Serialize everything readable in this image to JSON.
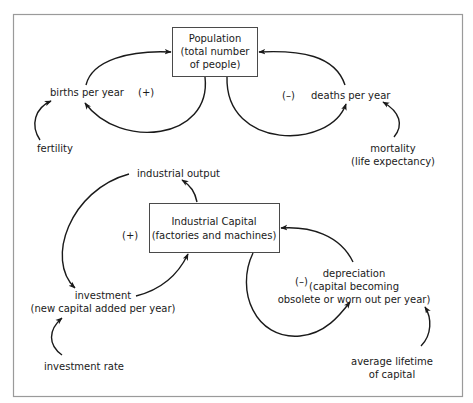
{
  "diagram": {
    "type": "causal-loop-diagram",
    "stocks": [
      {
        "id": "population",
        "lines": [
          "Population",
          "(total number",
          "of people)"
        ]
      },
      {
        "id": "industrial_capital",
        "lines": [
          "Industrial Capital",
          "(factories and machines)"
        ]
      }
    ],
    "variables": {
      "births": {
        "lines": [
          "births per year"
        ]
      },
      "deaths": {
        "lines": [
          "deaths per year"
        ]
      },
      "fertility": {
        "lines": [
          "fertility"
        ]
      },
      "mortality": {
        "lines": [
          "mortality",
          "(life expectancy)"
        ]
      },
      "industrial_output": {
        "lines": [
          "industrial output"
        ]
      },
      "investment": {
        "lines": [
          "investment",
          "(new capital added per year)"
        ]
      },
      "depreciation": {
        "lines": [
          "depreciation",
          "(capital becoming",
          "obsolete or worn out per year)"
        ]
      },
      "investment_rate": {
        "lines": [
          "investment rate"
        ]
      },
      "average_lifetime": {
        "lines": [
          "average lifetime",
          "of capital"
        ]
      }
    },
    "loop_signs": {
      "births_loop": "(+)",
      "deaths_loop": "(–)",
      "investment_loop": "(+)",
      "depreciation_loop": "(–)"
    },
    "links": [
      {
        "from": "births per year",
        "to": "Population"
      },
      {
        "from": "Population",
        "to": "births per year"
      },
      {
        "from": "fertility",
        "to": "births per year"
      },
      {
        "from": "deaths per year",
        "to": "Population"
      },
      {
        "from": "Population",
        "to": "deaths per year"
      },
      {
        "from": "mortality",
        "to": "deaths per year"
      },
      {
        "from": "Industrial Capital",
        "to": "industrial output"
      },
      {
        "from": "industrial output",
        "to": "investment"
      },
      {
        "from": "investment",
        "to": "Industrial Capital"
      },
      {
        "from": "investment rate",
        "to": "investment"
      },
      {
        "from": "depreciation",
        "to": "Industrial Capital"
      },
      {
        "from": "Industrial Capital",
        "to": "depreciation"
      },
      {
        "from": "average lifetime of capital",
        "to": "depreciation"
      }
    ],
    "colors": {
      "line": "#1a1a1a",
      "box_border": "#4a4a4a",
      "frame_border": "#9a9a9a",
      "background": "#ffffff"
    }
  }
}
